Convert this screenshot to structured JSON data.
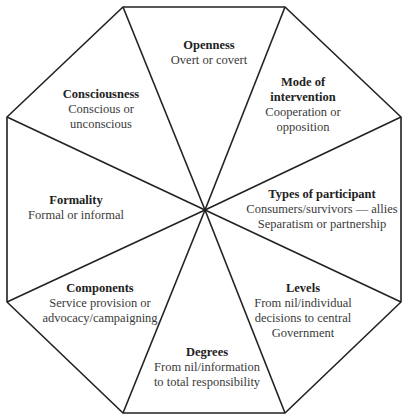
{
  "diagram": {
    "shape": "octagon",
    "stroke_color": "#222222",
    "background": "#ffffff",
    "segments": [
      {
        "id": "openness",
        "title": "Openness",
        "lines": [
          "Overt or covert"
        ]
      },
      {
        "id": "mode",
        "title": "Mode of intervention",
        "title_lines": [
          "Mode of",
          "intervention"
        ],
        "lines": [
          "Cooperation or",
          "opposition"
        ]
      },
      {
        "id": "types",
        "title": "Types of participant",
        "lines": [
          "Consumers/survivors — allies",
          "Separatism or partnership"
        ]
      },
      {
        "id": "levels",
        "title": "Levels",
        "lines": [
          "From nil/individual",
          "decisions to central",
          "Government"
        ]
      },
      {
        "id": "degrees",
        "title": "Degrees",
        "lines": [
          "From nil/information",
          "to total responsibility"
        ]
      },
      {
        "id": "components",
        "title": "Components",
        "lines": [
          "Service provision or",
          "advocacy/campaigning"
        ]
      },
      {
        "id": "formality",
        "title": "Formality",
        "lines": [
          "Formal or informal"
        ]
      },
      {
        "id": "consciousness",
        "title": "Consciousness",
        "lines": [
          "Conscious or",
          "unconscious"
        ]
      }
    ]
  }
}
